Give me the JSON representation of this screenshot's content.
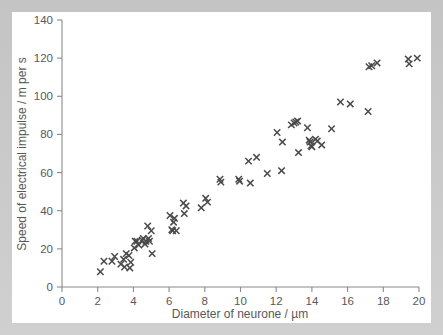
{
  "chart_data": {
    "type": "scatter",
    "title": "",
    "xlabel": "Diameter of neurone / µm",
    "ylabel": "Speed of electrical impulse / m per s",
    "xlim": [
      0,
      20
    ],
    "ylim": [
      0,
      140
    ],
    "xticks": [
      0,
      2,
      4,
      6,
      8,
      10,
      12,
      14,
      16,
      18,
      20
    ],
    "yticks": [
      0,
      20,
      40,
      60,
      80,
      100,
      120,
      140
    ],
    "xtick_labels": [
      "0",
      "2",
      "4",
      "6",
      "8",
      "10",
      "12",
      "14",
      "16",
      "18",
      "20"
    ],
    "ytick_labels": [
      "0",
      "20",
      "40",
      "60",
      "80",
      "100",
      "120",
      "140"
    ],
    "grid": false,
    "legend": null,
    "marker": "x",
    "marker_color": "#4a4a4c",
    "points": [
      [
        2.15,
        8.0
      ],
      [
        2.35,
        13.5
      ],
      [
        2.8,
        13.5
      ],
      [
        2.95,
        16.0
      ],
      [
        3.3,
        12.0
      ],
      [
        3.45,
        14.5
      ],
      [
        3.5,
        10.5
      ],
      [
        3.6,
        17.5
      ],
      [
        3.75,
        16.5
      ],
      [
        3.8,
        10.0
      ],
      [
        3.85,
        13.0
      ],
      [
        4.05,
        20.5
      ],
      [
        4.1,
        24.0
      ],
      [
        4.2,
        24.0
      ],
      [
        4.3,
        22.0
      ],
      [
        4.5,
        24.5
      ],
      [
        4.55,
        25.5
      ],
      [
        4.65,
        22.5
      ],
      [
        4.7,
        24.0
      ],
      [
        4.8,
        32.0
      ],
      [
        4.85,
        25.5
      ],
      [
        4.9,
        24.0
      ],
      [
        5.0,
        29.5
      ],
      [
        5.05,
        17.5
      ],
      [
        6.05,
        37.5
      ],
      [
        6.15,
        30.0
      ],
      [
        6.2,
        29.5
      ],
      [
        6.25,
        34.0
      ],
      [
        6.3,
        36.0
      ],
      [
        6.4,
        29.5
      ],
      [
        6.8,
        44.0
      ],
      [
        6.95,
        42.5
      ],
      [
        6.85,
        38.5
      ],
      [
        7.8,
        41.5
      ],
      [
        8.05,
        46.5
      ],
      [
        8.15,
        44.5
      ],
      [
        8.85,
        56.5
      ],
      [
        8.9,
        55.0
      ],
      [
        9.9,
        56.5
      ],
      [
        9.95,
        55.5
      ],
      [
        10.45,
        66.0
      ],
      [
        10.55,
        54.5
      ],
      [
        10.9,
        68.0
      ],
      [
        11.5,
        59.5
      ],
      [
        12.05,
        81.0
      ],
      [
        12.3,
        61.0
      ],
      [
        12.35,
        76.0
      ],
      [
        12.85,
        85.0
      ],
      [
        13.0,
        86.0
      ],
      [
        13.1,
        86.5
      ],
      [
        13.2,
        87.0
      ],
      [
        13.25,
        70.5
      ],
      [
        13.75,
        83.5
      ],
      [
        13.85,
        77.0
      ],
      [
        13.9,
        76.0
      ],
      [
        13.95,
        74.0
      ],
      [
        14.0,
        73.5
      ],
      [
        14.2,
        77.5
      ],
      [
        14.3,
        76.5
      ],
      [
        14.55,
        74.5
      ],
      [
        15.1,
        83.0
      ],
      [
        15.6,
        97.0
      ],
      [
        16.15,
        96.0
      ],
      [
        17.15,
        92.0
      ],
      [
        17.2,
        115.5
      ],
      [
        17.35,
        116.0
      ],
      [
        17.65,
        117.5
      ],
      [
        19.4,
        119.5
      ],
      [
        19.45,
        117.0
      ],
      [
        19.9,
        120.0
      ]
    ]
  },
  "axis": {
    "y_title": "Speed of electrical impulse / m per s",
    "x_title": "Diameter of neurone / µm"
  }
}
